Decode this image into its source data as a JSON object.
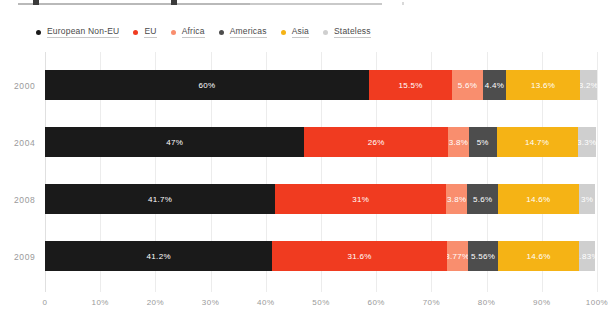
{
  "legend": {
    "items": [
      {
        "label": "European Non-EU",
        "color": "#1a1a1a",
        "icon": "legend-dot-icon"
      },
      {
        "label": "EU",
        "color": "#f03b20",
        "icon": "legend-dot-icon"
      },
      {
        "label": "Africa",
        "color": "#f98e6e",
        "icon": "legend-dot-icon"
      },
      {
        "label": "Americas",
        "color": "#4d4d4d",
        "icon": "legend-dot-icon"
      },
      {
        "label": "Asia",
        "color": "#f5b315",
        "icon": "legend-dot-icon"
      },
      {
        "label": "Stateless",
        "color": "#cfcfcf",
        "icon": "legend-dot-icon"
      }
    ]
  },
  "chart_data": {
    "type": "bar",
    "orientation": "horizontal",
    "stacked": "percent",
    "title": "",
    "subtitle": "",
    "xlabel": "",
    "ylabel": "",
    "xlim": [
      0,
      100
    ],
    "grid": true,
    "legend_position": "top-left",
    "categories": [
      "2000",
      "2004",
      "2008",
      "2009"
    ],
    "xticks": [
      "0",
      "10%",
      "20%",
      "30%",
      "40%",
      "50%",
      "60%",
      "70%",
      "80%",
      "90%",
      "100%"
    ],
    "xtick_values": [
      0,
      10,
      20,
      30,
      40,
      50,
      60,
      70,
      80,
      90,
      100
    ],
    "series": [
      {
        "name": "European Non-EU",
        "color": "#1a1a1a",
        "values": [
          60,
          47,
          41.7,
          41.2
        ],
        "labels": [
          "60%",
          "47%",
          "41.7%",
          "41.2%"
        ]
      },
      {
        "name": "EU",
        "color": "#f03b20",
        "values": [
          15.5,
          26,
          31,
          31.6
        ],
        "labels": [
          "15.5%",
          "26%",
          "31%",
          "31.6%"
        ]
      },
      {
        "name": "Africa",
        "color": "#f98e6e",
        "values": [
          5.6,
          3.8,
          3.8,
          3.77
        ],
        "labels": [
          "5.6%",
          "3.8%",
          "3.8%",
          "3.77%"
        ]
      },
      {
        "name": "Americas",
        "color": "#4d4d4d",
        "values": [
          4.4,
          5,
          5.6,
          5.56
        ],
        "labels": [
          "4.4%",
          "5%",
          "5.6%",
          "5.56%"
        ]
      },
      {
        "name": "Asia",
        "color": "#f5b315",
        "values": [
          13.6,
          14.7,
          14.6,
          14.6
        ],
        "labels": [
          "13.6%",
          "14.7%",
          "14.6%",
          "14.6%"
        ]
      },
      {
        "name": "Stateless",
        "color": "#cfcfcf",
        "values": [
          3.2,
          3.3,
          3,
          2.83
        ],
        "labels": [
          "3.2%",
          "3.3%",
          "3%",
          "2.83%"
        ]
      }
    ]
  }
}
